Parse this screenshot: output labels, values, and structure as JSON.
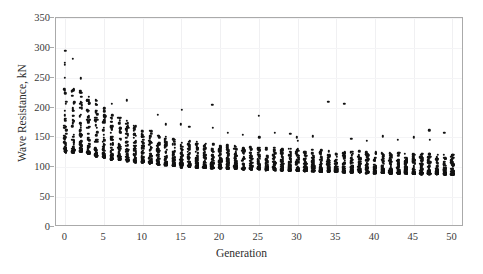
{
  "chart_data": {
    "type": "scatter",
    "title": "",
    "xlabel": "Generation",
    "ylabel": "Wave Resistance, kN",
    "xlim": [
      -1.2,
      51.5
    ],
    "ylim": [
      0,
      350
    ],
    "xticks": [
      0,
      5,
      10,
      15,
      20,
      25,
      30,
      35,
      40,
      45,
      50
    ],
    "yticks": [
      0,
      50,
      100,
      150,
      200,
      250,
      300,
      350
    ],
    "grid": true,
    "legend": null,
    "marker": {
      "shape": "circle",
      "color": "#121212",
      "size": 2.4
    },
    "series": [
      {
        "name": "Population individuals",
        "columns": [
          {
            "x": 0,
            "min": 125,
            "max": 295,
            "dense_low": 128,
            "dense_high": 238,
            "outliers": [
              295,
              275,
              272,
              250
            ]
          },
          {
            "x": 1,
            "min": 124,
            "max": 282,
            "dense_low": 126,
            "dense_high": 237,
            "outliers": [
              282
            ]
          },
          {
            "x": 2,
            "min": 126,
            "max": 249,
            "dense_low": 128,
            "dense_high": 230,
            "outliers": [
              249
            ]
          },
          {
            "x": 3,
            "min": 122,
            "max": 240,
            "dense_low": 124,
            "dense_high": 224,
            "outliers": []
          },
          {
            "x": 4,
            "min": 118,
            "max": 232,
            "dense_low": 120,
            "dense_high": 214,
            "outliers": []
          },
          {
            "x": 5,
            "min": 116,
            "max": 228,
            "dense_low": 118,
            "dense_high": 205,
            "outliers": []
          },
          {
            "x": 6,
            "min": 112,
            "max": 206,
            "dense_low": 114,
            "dense_high": 188,
            "outliers": [
              206
            ]
          },
          {
            "x": 7,
            "min": 112,
            "max": 196,
            "dense_low": 113,
            "dense_high": 183,
            "outliers": []
          },
          {
            "x": 8,
            "min": 110,
            "max": 212,
            "dense_low": 112,
            "dense_high": 178,
            "outliers": [
              212
            ]
          },
          {
            "x": 9,
            "min": 108,
            "max": 186,
            "dense_low": 110,
            "dense_high": 172,
            "outliers": []
          },
          {
            "x": 10,
            "min": 108,
            "max": 180,
            "dense_low": 109,
            "dense_high": 168,
            "outliers": []
          },
          {
            "x": 11,
            "min": 106,
            "max": 176,
            "dense_low": 107,
            "dense_high": 162,
            "outliers": []
          },
          {
            "x": 12,
            "min": 104,
            "max": 188,
            "dense_low": 106,
            "dense_high": 158,
            "outliers": [
              188
            ]
          },
          {
            "x": 13,
            "min": 103,
            "max": 172,
            "dense_low": 104,
            "dense_high": 152,
            "outliers": [
              172
            ]
          },
          {
            "x": 14,
            "min": 102,
            "max": 158,
            "dense_low": 103,
            "dense_high": 148,
            "outliers": []
          },
          {
            "x": 15,
            "min": 100,
            "max": 196,
            "dense_low": 102,
            "dense_high": 146,
            "outliers": [
              196,
              172
            ]
          },
          {
            "x": 16,
            "min": 100,
            "max": 168,
            "dense_low": 101,
            "dense_high": 145,
            "outliers": [
              168
            ]
          },
          {
            "x": 17,
            "min": 99,
            "max": 160,
            "dense_low": 100,
            "dense_high": 143,
            "outliers": []
          },
          {
            "x": 18,
            "min": 99,
            "max": 158,
            "dense_low": 100,
            "dense_high": 142,
            "outliers": []
          },
          {
            "x": 19,
            "min": 98,
            "max": 205,
            "dense_low": 99,
            "dense_high": 140,
            "outliers": [
              205,
              166
            ]
          },
          {
            "x": 20,
            "min": 98,
            "max": 152,
            "dense_low": 99,
            "dense_high": 139,
            "outliers": []
          },
          {
            "x": 21,
            "min": 97,
            "max": 158,
            "dense_low": 98,
            "dense_high": 138,
            "outliers": [
              158
            ]
          },
          {
            "x": 22,
            "min": 97,
            "max": 150,
            "dense_low": 98,
            "dense_high": 137,
            "outliers": []
          },
          {
            "x": 23,
            "min": 96,
            "max": 154,
            "dense_low": 97,
            "dense_high": 136,
            "outliers": [
              154
            ]
          },
          {
            "x": 24,
            "min": 96,
            "max": 148,
            "dense_low": 97,
            "dense_high": 135,
            "outliers": []
          },
          {
            "x": 25,
            "min": 96,
            "max": 186,
            "dense_low": 97,
            "dense_high": 134,
            "outliers": [
              186,
              150
            ]
          },
          {
            "x": 26,
            "min": 95,
            "max": 146,
            "dense_low": 96,
            "dense_high": 134,
            "outliers": []
          },
          {
            "x": 27,
            "min": 95,
            "max": 158,
            "dense_low": 96,
            "dense_high": 133,
            "outliers": [
              158
            ]
          },
          {
            "x": 28,
            "min": 94,
            "max": 148,
            "dense_low": 95,
            "dense_high": 132,
            "outliers": []
          },
          {
            "x": 29,
            "min": 94,
            "max": 156,
            "dense_low": 95,
            "dense_high": 132,
            "outliers": [
              156
            ]
          },
          {
            "x": 30,
            "min": 94,
            "max": 150,
            "dense_low": 95,
            "dense_high": 131,
            "outliers": [
              150,
              144
            ]
          },
          {
            "x": 31,
            "min": 93,
            "max": 145,
            "dense_low": 94,
            "dense_high": 130,
            "outliers": []
          },
          {
            "x": 32,
            "min": 93,
            "max": 152,
            "dense_low": 94,
            "dense_high": 130,
            "outliers": [
              152
            ]
          },
          {
            "x": 33,
            "min": 92,
            "max": 142,
            "dense_low": 93,
            "dense_high": 129,
            "outliers": []
          },
          {
            "x": 34,
            "min": 92,
            "max": 210,
            "dense_low": 93,
            "dense_high": 129,
            "outliers": [
              210
            ]
          },
          {
            "x": 35,
            "min": 92,
            "max": 140,
            "dense_low": 93,
            "dense_high": 128,
            "outliers": []
          },
          {
            "x": 36,
            "min": 91,
            "max": 206,
            "dense_low": 92,
            "dense_high": 128,
            "outliers": [
              206
            ]
          },
          {
            "x": 37,
            "min": 91,
            "max": 148,
            "dense_low": 92,
            "dense_high": 127,
            "outliers": [
              148
            ]
          },
          {
            "x": 38,
            "min": 91,
            "max": 138,
            "dense_low": 92,
            "dense_high": 127,
            "outliers": []
          },
          {
            "x": 39,
            "min": 90,
            "max": 144,
            "dense_low": 91,
            "dense_high": 126,
            "outliers": [
              144
            ]
          },
          {
            "x": 40,
            "min": 90,
            "max": 136,
            "dense_low": 91,
            "dense_high": 126,
            "outliers": []
          },
          {
            "x": 41,
            "min": 90,
            "max": 152,
            "dense_low": 91,
            "dense_high": 125,
            "outliers": [
              152
            ]
          },
          {
            "x": 42,
            "min": 89,
            "max": 142,
            "dense_low": 90,
            "dense_high": 125,
            "outliers": []
          },
          {
            "x": 43,
            "min": 89,
            "max": 146,
            "dense_low": 90,
            "dense_high": 124,
            "outliers": [
              146
            ]
          },
          {
            "x": 44,
            "min": 89,
            "max": 138,
            "dense_low": 90,
            "dense_high": 124,
            "outliers": []
          },
          {
            "x": 45,
            "min": 88,
            "max": 150,
            "dense_low": 89,
            "dense_high": 124,
            "outliers": [
              150
            ]
          },
          {
            "x": 46,
            "min": 88,
            "max": 140,
            "dense_low": 89,
            "dense_high": 123,
            "outliers": []
          },
          {
            "x": 47,
            "min": 88,
            "max": 162,
            "dense_low": 89,
            "dense_high": 123,
            "outliers": [
              162,
              146
            ]
          },
          {
            "x": 48,
            "min": 88,
            "max": 136,
            "dense_low": 89,
            "dense_high": 122,
            "outliers": []
          },
          {
            "x": 49,
            "min": 87,
            "max": 158,
            "dense_low": 88,
            "dense_high": 122,
            "outliers": [
              158
            ]
          },
          {
            "x": 50,
            "min": 87,
            "max": 132,
            "dense_low": 88,
            "dense_high": 122,
            "outliers": []
          }
        ]
      }
    ]
  }
}
